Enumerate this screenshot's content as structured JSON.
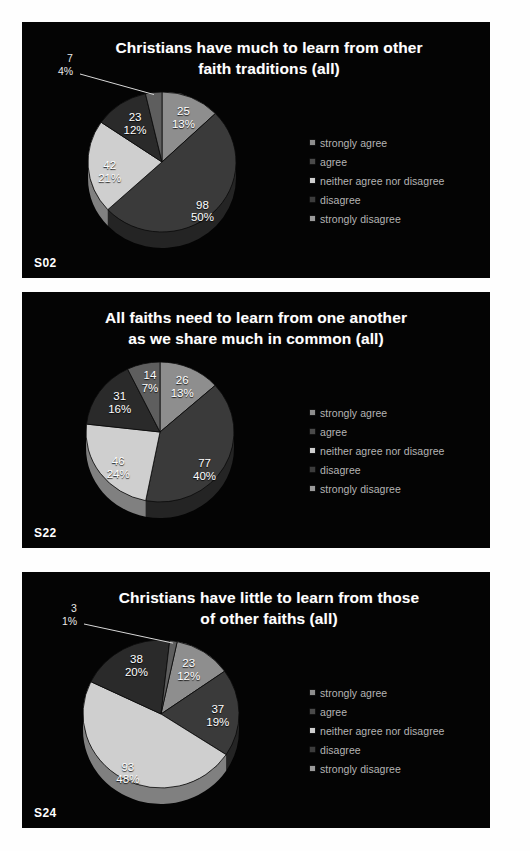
{
  "page": {
    "background": "#ffffff",
    "slide_background": "#040404"
  },
  "palette": {
    "strongly_agree": "#8e8e8e",
    "agree": "#3a3a3a",
    "neither": "#cfcfcf",
    "disagree": "#2a2a2a",
    "strongly_disagree": "#5e5e5e",
    "label_text": "#ffffff",
    "legend_text": "#b4b4b4",
    "title_text": "#ffffff"
  },
  "legend": {
    "items": [
      {
        "label": "strongly agree",
        "color": "#8e8e8e",
        "swatch": "legend-swatch-strongly-agree"
      },
      {
        "label": "agree",
        "color": "#4a4a4a",
        "swatch": "legend-swatch-agree"
      },
      {
        "label": "neither agree nor disagree",
        "color": "#cfcfcf",
        "swatch": "legend-swatch-neither"
      },
      {
        "label": "disagree",
        "color": "#3c3c3c",
        "swatch": "legend-swatch-disagree"
      },
      {
        "label": "strongly disagree",
        "color": "#9a9a9a",
        "swatch": "legend-swatch-strongly-disagree"
      }
    ]
  },
  "slides": [
    {
      "id": "S02",
      "title_line1": "Christians have much to learn from other",
      "title_line2": "faith traditions (all)",
      "callout": {
        "count": "7",
        "percent": "4%"
      }
    },
    {
      "id": "S22",
      "title_line1": "All faiths need to learn from one another",
      "title_line2": "as we share much in common (all)",
      "callout": null
    },
    {
      "id": "S24",
      "title_line1": "Christians have little to learn from those",
      "title_line2": "of other faiths (all)",
      "callout": {
        "count": "3",
        "percent": "1%"
      }
    }
  ],
  "chart_data": [
    {
      "type": "pie",
      "title": "Christians have much to learn from other faith traditions (all)",
      "slide_id": "S02",
      "legend_position": "right",
      "total": 195,
      "categories": [
        "strongly agree",
        "agree",
        "neither agree nor disagree",
        "disagree",
        "strongly disagree"
      ],
      "values": [
        25,
        98,
        42,
        23,
        7
      ],
      "percents": [
        "13%",
        "50%",
        "21%",
        "12%",
        "4%"
      ],
      "labels": [
        {
          "category": "strongly agree",
          "count": "25",
          "percent": "13%"
        },
        {
          "category": "agree",
          "count": "98",
          "percent": "50%"
        },
        {
          "category": "neither agree nor disagree",
          "count": "42",
          "percent": "21%"
        },
        {
          "category": "disagree",
          "count": "23",
          "percent": "12%"
        },
        {
          "category": "strongly disagree",
          "count": "7",
          "percent": "4%"
        }
      ]
    },
    {
      "type": "pie",
      "title": "All faiths need to learn from one another as we share much in common (all)",
      "slide_id": "S22",
      "legend_position": "right",
      "total": 194,
      "categories": [
        "strongly agree",
        "agree",
        "neither agree nor disagree",
        "disagree",
        "strongly disagree"
      ],
      "values": [
        26,
        77,
        46,
        31,
        14
      ],
      "percents": [
        "13%",
        "40%",
        "24%",
        "16%",
        "7%"
      ],
      "labels": [
        {
          "category": "strongly agree",
          "count": "26",
          "percent": "13%"
        },
        {
          "category": "agree",
          "count": "77",
          "percent": "40%"
        },
        {
          "category": "neither agree nor disagree",
          "count": "46",
          "percent": "24%"
        },
        {
          "category": "disagree",
          "count": "31",
          "percent": "16%"
        },
        {
          "category": "strongly disagree",
          "count": "14",
          "percent": "7%"
        }
      ]
    },
    {
      "type": "pie",
      "title": "Christians have little to learn from those of other faiths (all)",
      "slide_id": "S24",
      "legend_position": "right",
      "total": 194,
      "categories": [
        "strongly agree",
        "agree",
        "neither agree nor disagree",
        "disagree",
        "strongly disagree"
      ],
      "values": [
        23,
        37,
        93,
        38,
        3
      ],
      "percents": [
        "12%",
        "19%",
        "48%",
        "20%",
        "1%"
      ],
      "labels": [
        {
          "category": "strongly agree",
          "count": "23",
          "percent": "12%"
        },
        {
          "category": "agree",
          "count": "37",
          "percent": "19%"
        },
        {
          "category": "neither agree nor disagree",
          "count": "93",
          "percent": "48%"
        },
        {
          "category": "disagree",
          "count": "38",
          "percent": "20%"
        },
        {
          "category": "strongly disagree",
          "count": "3",
          "percent": "1%"
        }
      ]
    }
  ]
}
